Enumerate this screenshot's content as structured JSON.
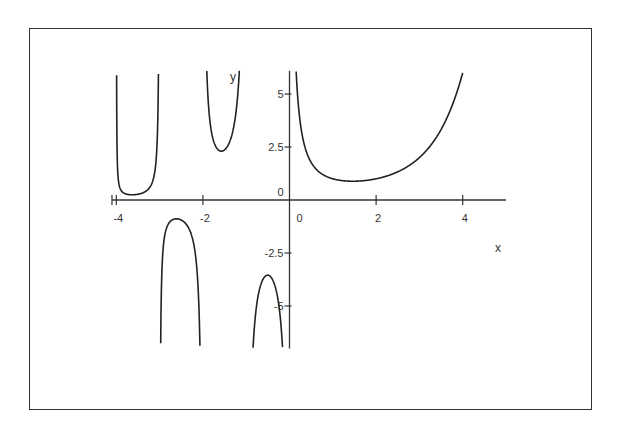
{
  "chart_data": {
    "type": "line",
    "title": "",
    "xlabel": "x",
    "ylabel": "y",
    "function": "Gamma(x)",
    "xlim": [
      -4.1,
      5
    ],
    "ylim": [
      -7,
      6.1
    ],
    "grid": false,
    "legend": null,
    "x_ticks": [
      -4,
      -2,
      0,
      2,
      4
    ],
    "x_tick_labels": [
      "-4",
      "-2",
      "0",
      "2",
      "4"
    ],
    "y_ticks": [
      5,
      2.5,
      0,
      -2.5,
      -5
    ],
    "y_tick_labels": [
      "5",
      "2.5",
      "0",
      "-2.5",
      "-5"
    ],
    "series": [
      {
        "name": "branch (-4,-3)",
        "x": [
          -3.99,
          -3.97,
          -3.93,
          -3.85,
          -3.75,
          -3.63,
          -3.5,
          -3.4,
          -3.3,
          -3.2,
          -3.1,
          -3.05,
          -3.02,
          -3.01
        ],
        "y": [
          6.1,
          1.43,
          0.39,
          0.16,
          0.08,
          0.05,
          0.04,
          0.05,
          0.07,
          0.12,
          0.26,
          0.55,
          1.36,
          2.73
        ]
      },
      {
        "name": "branch (-3,-2)",
        "x": [
          -2.98,
          -2.95,
          -2.9,
          -2.8,
          -2.7,
          -2.61,
          -2.5,
          -2.4,
          -2.3,
          -2.2,
          -2.1,
          -2.05,
          -2.02
        ],
        "y": [
          -7,
          -2.45,
          -1.49,
          -1.01,
          -0.91,
          -0.89,
          -0.95,
          -1.09,
          -1.37,
          -1.93,
          -3.58,
          -6.95,
          -7
        ]
      },
      {
        "name": "branch (-2,-1)",
        "x": [
          -1.99,
          -1.95,
          -1.9,
          -1.8,
          -1.7,
          -1.6,
          -1.54,
          -1.45,
          -1.35,
          -1.25,
          -1.2,
          -1.15,
          -1.12
        ],
        "y": [
          6.1,
          10.4,
          5.5,
          3.14,
          2.49,
          2.31,
          2.3,
          2.35,
          2.7,
          3.56,
          4.57,
          6.1,
          6.1
        ]
      },
      {
        "name": "branch (-1,0)",
        "x": [
          -0.93,
          -0.9,
          -0.8,
          -0.7,
          -0.6,
          -0.5,
          -0.4,
          -0.3,
          -0.2,
          -0.15,
          -0.1,
          -0.07
        ],
        "y": [
          -7,
          -10.6,
          -5.74,
          -4.27,
          -3.7,
          -3.54,
          -3.72,
          -4.33,
          -5.82,
          -7,
          -10.7,
          -7
        ]
      },
      {
        "name": "branch (0,5)",
        "x": [
          0.16,
          0.2,
          0.3,
          0.4,
          0.5,
          0.7,
          1.0,
          1.46,
          2.0,
          2.5,
          3.0,
          3.5,
          4.0
        ],
        "y": [
          6.1,
          4.59,
          2.99,
          2.22,
          1.77,
          1.3,
          1.0,
          0.886,
          1.0,
          1.33,
          2.0,
          3.32,
          6.0
        ]
      }
    ]
  }
}
